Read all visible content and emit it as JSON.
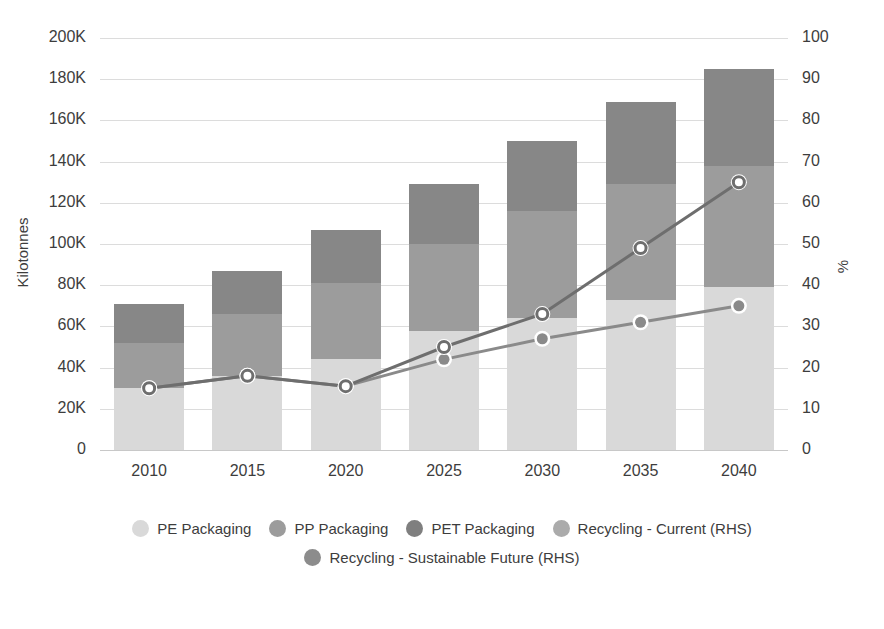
{
  "chart_data": {
    "type": "bar",
    "title": "",
    "subtitle": "",
    "xlabel": "",
    "ylabel": "Kilotonnes",
    "y2label": "%",
    "categories": [
      "2010",
      "2015",
      "2020",
      "2025",
      "2030",
      "2035",
      "2040"
    ],
    "ylim": [
      0,
      200000
    ],
    "y2lim": [
      0,
      100
    ],
    "yticks": [
      "0",
      "20K",
      "40K",
      "60K",
      "80K",
      "100K",
      "120K",
      "140K",
      "160K",
      "180K",
      "200K"
    ],
    "ytick_values": [
      0,
      20000,
      40000,
      60000,
      80000,
      100000,
      120000,
      140000,
      160000,
      180000,
      200000
    ],
    "y2ticks": [
      "0",
      "10",
      "20",
      "30",
      "40",
      "50",
      "60",
      "70",
      "80",
      "90",
      "100"
    ],
    "y2tick_values": [
      0,
      10,
      20,
      30,
      40,
      50,
      60,
      70,
      80,
      90,
      100
    ],
    "grid": true,
    "stacked": true,
    "legend_position": "bottom",
    "series": [
      {
        "name": "PE Packaging",
        "kind": "bar",
        "axis": "left",
        "color": "#d9d9d9",
        "values": [
          30000,
          36000,
          44000,
          58000,
          64000,
          73000,
          79000
        ]
      },
      {
        "name": "PP Packaging",
        "kind": "bar",
        "axis": "left",
        "color": "#9c9c9c",
        "values": [
          22000,
          30000,
          37000,
          42000,
          52000,
          56000,
          59000
        ]
      },
      {
        "name": "PET Packaging",
        "kind": "bar",
        "axis": "left",
        "color": "#878787",
        "values": [
          19000,
          21000,
          26000,
          29000,
          34000,
          40000,
          47000
        ]
      },
      {
        "name": "Recycling - Current (RHS)",
        "kind": "line",
        "axis": "right",
        "color": "#8a8a8a",
        "marker": "filled-circle",
        "values": [
          15,
          18,
          15.5,
          22,
          27,
          31,
          35
        ]
      },
      {
        "name": "Recycling - Sustainable Future (RHS)",
        "kind": "line",
        "axis": "right",
        "color": "#6e6e6e",
        "marker": "open-circle",
        "values": [
          15,
          18,
          15.5,
          25,
          33,
          49,
          65
        ]
      }
    ],
    "totals": [
      71000,
      87000,
      107000,
      129000,
      150000,
      169000,
      185000
    ]
  },
  "legend": {
    "rows": [
      [
        {
          "label": "PE Packaging",
          "color": "#d9d9d9"
        },
        {
          "label": "PP Packaging",
          "color": "#9c9c9c"
        },
        {
          "label": "PET Packaging",
          "color": "#7f7f7f"
        },
        {
          "label": "Recycling - Current (RHS)",
          "color": "#ababab"
        }
      ],
      [
        {
          "label": "Recycling - Sustainable Future (RHS)",
          "color": "#8c8c8c"
        }
      ]
    ]
  },
  "colors": {
    "pe": "#d9d9d9",
    "pp": "#9c9c9c",
    "pet": "#878787",
    "line_current": "#8a8a8a",
    "line_sustainable": "#6e6e6e",
    "grid": "#dcdcdc",
    "text": "#3d3d3d",
    "background": "#ffffff"
  }
}
